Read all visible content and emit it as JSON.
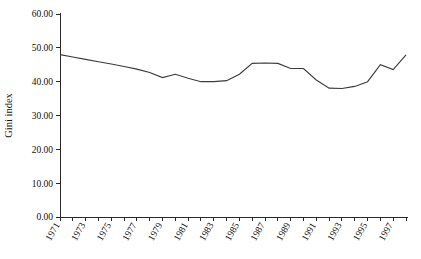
{
  "chart_data": {
    "type": "line",
    "title": "",
    "xlabel": "",
    "ylabel": "Gini index",
    "ylim": [
      0.0,
      60.0
    ],
    "ytick_labels": [
      "0.00",
      "10.00",
      "20.00",
      "30.00",
      "40.00",
      "50.00",
      "60.00"
    ],
    "ytick_values": [
      0.0,
      10.0,
      20.0,
      30.0,
      40.0,
      50.0,
      60.0
    ],
    "xlim": [
      1971,
      1998
    ],
    "xtick_labels": [
      "1971",
      "1973",
      "1975",
      "1977",
      "1979",
      "1981",
      "1983",
      "1985",
      "1987",
      "1989",
      "1991",
      "1993",
      "1995",
      "1997"
    ],
    "grid": false,
    "legend": false,
    "legend_position": "none",
    "x": [
      1971,
      1972,
      1973,
      1974,
      1975,
      1976,
      1977,
      1978,
      1979,
      1980,
      1981,
      1982,
      1983,
      1984,
      1985,
      1986,
      1987,
      1988,
      1989,
      1990,
      1991,
      1992,
      1993,
      1994,
      1995,
      1996,
      1997,
      1998
    ],
    "values": [
      48.0,
      47.3,
      46.6,
      45.9,
      45.2,
      44.5,
      43.7,
      42.7,
      41.2,
      42.2,
      41.0,
      40.0,
      40.0,
      40.3,
      42.2,
      45.4,
      45.5,
      45.4,
      43.9,
      43.9,
      40.5,
      38.1,
      38.0,
      38.6,
      40.0,
      45.0,
      43.6,
      47.9
    ],
    "series": [
      {
        "name": "Gini index",
        "color": "#3b3b3b",
        "values": [
          48.0,
          47.3,
          46.6,
          45.9,
          45.2,
          44.5,
          43.7,
          42.7,
          41.2,
          42.2,
          41.0,
          40.0,
          40.0,
          40.3,
          42.2,
          45.4,
          45.5,
          45.4,
          43.9,
          43.9,
          40.5,
          38.1,
          38.0,
          38.6,
          40.0,
          45.0,
          43.6,
          47.9
        ]
      }
    ]
  },
  "axes": {
    "y_axis_title": "Gini index"
  }
}
